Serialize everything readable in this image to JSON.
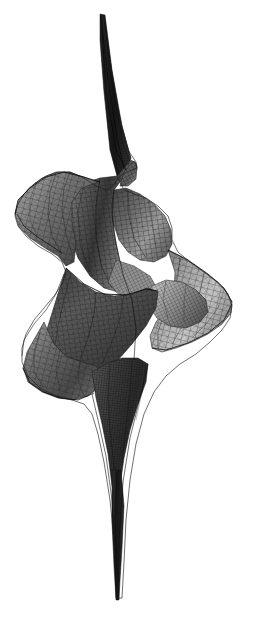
{
  "figure": {
    "kind": "3d-surface-wireframe-plot",
    "title": "",
    "caption_fragment": "",
    "background_color": "#ffffff",
    "ink_color": "#1b1b1b",
    "render_style": "shaded quadrilateral mesh with visible grid lines",
    "colormap": "grayscale",
    "tone_min": "#141414",
    "tone_max": "#e2e2e2",
    "tone_mid": "#7d7d7d",
    "has_axes": false,
    "has_gridlines_background": false,
    "has_legend": false,
    "has_tick_labels": false,
    "bounding_box_px": {
      "left": 14,
      "top": 14,
      "right": 232,
      "bottom": 600
    }
  },
  "chart_data": {
    "type": "surface",
    "title": "",
    "xlabel": "",
    "ylabel": "",
    "zlabel": "",
    "projection": "3d-perspective",
    "shading": "grayscale-lambertian",
    "wireframe": true,
    "mesh": {
      "u_divisions": 96,
      "v_divisions": 64,
      "line_color": "#202020",
      "line_width": 0.35
    },
    "u_range": [
      0,
      6.283185307179586
    ],
    "v_range": [
      -3.0,
      3.0
    ],
    "features": [
      {
        "name": "upper-cusp-spike",
        "center_px": [
          96,
          18
        ],
        "extent_px": [
          88,
          160
        ]
      },
      {
        "name": "upper-left-flange",
        "center_px": [
          52,
          205
        ],
        "extent_px": [
          14,
          175
        ]
      },
      {
        "name": "upper-fin-point",
        "center_px": [
          137,
          166
        ],
        "extent_px": [
          120,
          150
        ]
      },
      {
        "name": "mid-right-lobe",
        "center_px": [
          175,
          255
        ],
        "extent_px": [
          135,
          215
        ]
      },
      {
        "name": "central-self-intersection",
        "center_px": [
          124,
          308
        ],
        "extent_px": [
          85,
          275
        ]
      },
      {
        "name": "lower-right-flange",
        "center_px": [
          190,
          320
        ],
        "extent_px": [
          150,
          285
        ]
      },
      {
        "name": "lower-left-lobe",
        "center_px": [
          58,
          375
        ],
        "extent_px": [
          16,
          330
        ]
      },
      {
        "name": "lower-cusp-spike",
        "center_px": [
          118,
          560
        ],
        "extent_px": [
          100,
          470
        ]
      }
    ],
    "silhouette_outline_px": [
      [
        101,
        15
      ],
      [
        104,
        16
      ],
      [
        110,
        60
      ],
      [
        118,
        110
      ],
      [
        128,
        150
      ],
      [
        136,
        162
      ],
      [
        137,
        168
      ],
      [
        126,
        172
      ],
      [
        118,
        178
      ],
      [
        113,
        186
      ],
      [
        106,
        190
      ],
      [
        96,
        186
      ],
      [
        84,
        178
      ],
      [
        70,
        172
      ],
      [
        58,
        172
      ],
      [
        46,
        176
      ],
      [
        34,
        184
      ],
      [
        24,
        194
      ],
      [
        17,
        206
      ],
      [
        15,
        216
      ],
      [
        18,
        226
      ],
      [
        26,
        236
      ],
      [
        38,
        246
      ],
      [
        52,
        254
      ],
      [
        62,
        262
      ],
      [
        66,
        272
      ],
      [
        62,
        284
      ],
      [
        54,
        296
      ],
      [
        44,
        308
      ],
      [
        34,
        320
      ],
      [
        26,
        334
      ],
      [
        22,
        348
      ],
      [
        22,
        362
      ],
      [
        28,
        376
      ],
      [
        40,
        388
      ],
      [
        56,
        396
      ],
      [
        72,
        400
      ],
      [
        84,
        404
      ],
      [
        92,
        414
      ],
      [
        98,
        434
      ],
      [
        104,
        462
      ],
      [
        110,
        500
      ],
      [
        114,
        540
      ],
      [
        117,
        576
      ],
      [
        118,
        598
      ],
      [
        122,
        598
      ],
      [
        124,
        562
      ],
      [
        126,
        520
      ],
      [
        130,
        480
      ],
      [
        136,
        444
      ],
      [
        144,
        414
      ],
      [
        154,
        392
      ],
      [
        166,
        376
      ],
      [
        180,
        364
      ],
      [
        196,
        354
      ],
      [
        210,
        342
      ],
      [
        222,
        330
      ],
      [
        230,
        318
      ],
      [
        232,
        306
      ],
      [
        228,
        294
      ],
      [
        218,
        282
      ],
      [
        204,
        272
      ],
      [
        190,
        262
      ],
      [
        178,
        252
      ],
      [
        172,
        240
      ],
      [
        172,
        228
      ],
      [
        168,
        216
      ],
      [
        158,
        206
      ],
      [
        146,
        198
      ],
      [
        134,
        194
      ],
      [
        124,
        190
      ],
      [
        118,
        178
      ],
      [
        112,
        150
      ],
      [
        106,
        100
      ],
      [
        102,
        50
      ],
      [
        101,
        15
      ]
    ],
    "grid_on": false,
    "legend_position": "none",
    "values_labeled": false
  }
}
